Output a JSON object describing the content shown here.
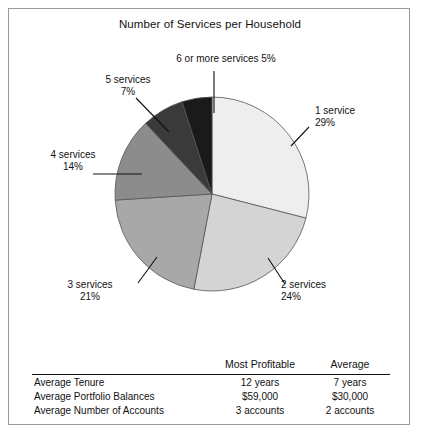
{
  "chart_data": {
    "type": "pie",
    "title": "Number of Services per Household",
    "categories": [
      "1 service",
      "2 services",
      "3 services",
      "4 services",
      "5 services",
      "6 or more services"
    ],
    "values": [
      29,
      24,
      21,
      14,
      7,
      5
    ],
    "value_labels": [
      "29%",
      "24%",
      "21%",
      "14%",
      "7%",
      "5%"
    ],
    "units": "percent",
    "start_angle_deg": 0,
    "direction": "clockwise",
    "legend": "none",
    "labels_position": "outside-with-leader-lines",
    "slice_colors": [
      "#eeeeee",
      "#d4d4d4",
      "#a8a8a8",
      "#8c8c8c",
      "#3a3a3a",
      "#1a1a1a"
    ],
    "slice_edge_color": "#555555"
  },
  "figure": {
    "title": "Number of Services per Household",
    "border_color": "#9a9a9a",
    "background": "#ffffff"
  },
  "pie_labels": [
    {
      "id": "s1",
      "name": "1 service",
      "pct": "29%",
      "align": "lab-right"
    },
    {
      "id": "s2",
      "name": "2 services",
      "pct": "24%",
      "align": "lab-right"
    },
    {
      "id": "s3",
      "name": "3 services",
      "pct": "21%",
      "align": "lab-center"
    },
    {
      "id": "s4",
      "name": "4 services",
      "pct": "14%",
      "align": "lab-center"
    },
    {
      "id": "s5",
      "name": "5 services",
      "pct": "7%",
      "align": "lab-center"
    },
    {
      "id": "s6",
      "name": "6 or more services 5%",
      "pct": "",
      "align": "lab-center"
    }
  ],
  "table": {
    "columns": [
      "",
      "Most Profitable",
      "Average"
    ],
    "rows": [
      {
        "label": "Average Tenure",
        "most_profitable": "12 years",
        "average": "7 years"
      },
      {
        "label": "Average Portfolio Balances",
        "most_profitable": "$59,000",
        "average": "$30,000"
      },
      {
        "label": "Average Number of Accounts",
        "most_profitable": "3 accounts",
        "average": "2 accounts"
      }
    ]
  }
}
